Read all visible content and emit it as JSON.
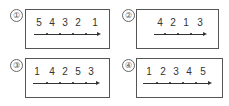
{
  "options": [
    {
      "marker": "①",
      "sequence": [
        "5",
        "4",
        "3",
        "2",
        "1"
      ],
      "ticks": 5
    },
    {
      "marker": "②",
      "sequence": [
        "4",
        "2",
        "1",
        "3"
      ],
      "ticks": 4
    },
    {
      "marker": "③",
      "sequence": [
        "1",
        "4",
        "2",
        "5",
        "3"
      ],
      "ticks": 5
    },
    {
      "marker": "④",
      "sequence": [
        "1",
        "2",
        "3",
        "4",
        "5"
      ],
      "ticks": 5
    }
  ]
}
